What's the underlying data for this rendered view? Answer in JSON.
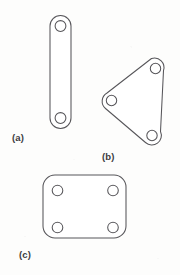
{
  "figure": {
    "background_color": "#fdfdfc",
    "stroke_color": "#57565a",
    "fill_color": "#ffffff",
    "label_color": "#3c3b3f",
    "width": 180,
    "height": 275
  },
  "labels": {
    "a": "(a)",
    "b": "(b)",
    "c": "(c)",
    "a_name": "binary-link",
    "b_name": "ternary-link",
    "c_name": "quaternary-link"
  },
  "shapes": {
    "binary_link": {
      "outline": "M 50 26 A 10.5 10.5 0 0 1 71 26 L 71 118 A 10.5 10.5 0 0 1 50 118 Z",
      "holes": [
        {
          "cx": 60.5,
          "cy": 26,
          "r": 5.4
        },
        {
          "cx": 60.5,
          "cy": 118,
          "r": 5.4
        }
      ]
    },
    "ternary_link": {
      "outline": "M 151.5 58.5 A 9.5 9.5 0 0 1 163.5 70.5 L 160.5 131.5 A 9.5 9.5 0 0 1 145.5 142.5 L 105.5 108.5 A 9.5 9.5 0 0 1 107 93 Z",
      "holes": [
        {
          "cx": 155.5,
          "cy": 68.5,
          "r": 5.2
        },
        {
          "cx": 111.5,
          "cy": 100.5,
          "r": 5.2
        },
        {
          "cx": 152.0,
          "cy": 135.5,
          "r": 5.2
        }
      ]
    },
    "quaternary_link": {
      "outline": "M 55 175 L 114 175 A 12 12 0 0 1 126 187 L 126 226 A 12 12 0 0 1 114 238 L 55 238 A 12 12 0 0 1 43 226 L 43 187 A 12 12 0 0 1 55 175 Z",
      "holes": [
        {
          "cx": 57.5,
          "cy": 190.5,
          "r": 5.3
        },
        {
          "cx": 113.0,
          "cy": 190.5,
          "r": 5.3
        },
        {
          "cx": 57.5,
          "cy": 227.5,
          "r": 5.3
        },
        {
          "cx": 113.0,
          "cy": 227.5,
          "r": 5.3
        }
      ]
    }
  }
}
